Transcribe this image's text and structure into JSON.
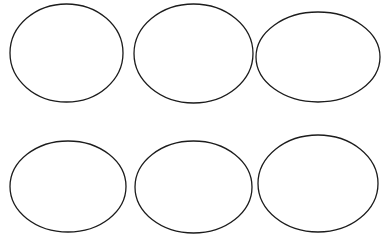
{
  "canvas": {
    "width": 385,
    "height": 240,
    "background_color": "#ffffff",
    "stroke_color": "#1c1c1c",
    "stroke_width": 1.3,
    "fill": "none"
  },
  "ellipses": [
    {
      "name": "ellipse-top-left",
      "cx": 66.5,
      "cy": 53,
      "rx": 56.5,
      "ry": 49
    },
    {
      "name": "ellipse-top-center",
      "cx": 193.5,
      "cy": 53.5,
      "rx": 59.5,
      "ry": 49.5
    },
    {
      "name": "ellipse-top-right",
      "cx": 318,
      "cy": 57,
      "rx": 62,
      "ry": 45
    },
    {
      "name": "ellipse-bottom-left",
      "cx": 68,
      "cy": 186.5,
      "rx": 58,
      "ry": 45.5
    },
    {
      "name": "ellipse-bottom-center",
      "cx": 193.5,
      "cy": 187,
      "rx": 58.5,
      "ry": 46
    },
    {
      "name": "ellipse-bottom-right",
      "cx": 318,
      "cy": 183.5,
      "rx": 60,
      "ry": 48.5
    }
  ]
}
